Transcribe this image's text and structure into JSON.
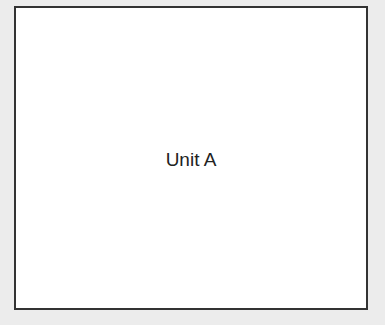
{
  "diagram": {
    "unit": {
      "label": "Unit A"
    }
  },
  "colors": {
    "background": "#ececec",
    "box_fill": "#ffffff",
    "box_border": "#333333",
    "text": "#222222"
  }
}
